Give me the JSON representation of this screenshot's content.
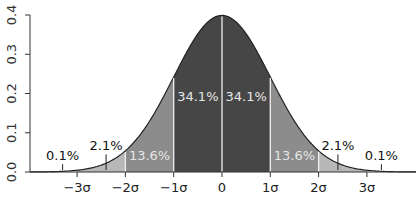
{
  "chart_data": {
    "type": "area",
    "title": "",
    "xlabel": "",
    "ylabel": "",
    "xlim": [
      -4,
      4
    ],
    "ylim": [
      0,
      0.4
    ],
    "grid": false,
    "x_ticks": [
      {
        "value": -3,
        "label": "−3σ"
      },
      {
        "value": -2,
        "label": "−2σ"
      },
      {
        "value": -1,
        "label": "−1σ"
      },
      {
        "value": 0,
        "label": "0"
      },
      {
        "value": 1,
        "label": "1σ"
      },
      {
        "value": 2,
        "label": "2σ"
      },
      {
        "value": 3,
        "label": "3σ"
      }
    ],
    "y_ticks": [
      {
        "value": 0.0,
        "label": "0.0"
      },
      {
        "value": 0.1,
        "label": "0.1"
      },
      {
        "value": 0.2,
        "label": "0.2"
      },
      {
        "value": 0.3,
        "label": "0.3"
      },
      {
        "value": 0.4,
        "label": "0.4"
      }
    ],
    "series": [
      {
        "name": "standard normal density",
        "function": "N(0,1) pdf",
        "peak": 0.399
      }
    ],
    "regions": [
      {
        "from": -4,
        "to": -3,
        "percent": "0.1%",
        "color": "#ffffff"
      },
      {
        "from": -3,
        "to": -2,
        "percent": "2.1%",
        "color": "#b8b8b8"
      },
      {
        "from": -2,
        "to": -1,
        "percent": "13.6%",
        "color": "#8c8c8c"
      },
      {
        "from": -1,
        "to": 0,
        "percent": "34.1%",
        "color": "#464646"
      },
      {
        "from": 0,
        "to": 1,
        "percent": "34.1%",
        "color": "#464646"
      },
      {
        "from": 1,
        "to": 2,
        "percent": "13.6%",
        "color": "#8c8c8c"
      },
      {
        "from": 2,
        "to": 3,
        "percent": "2.1%",
        "color": "#b8b8b8"
      },
      {
        "from": 3,
        "to": 4,
        "percent": "0.1%",
        "color": "#ffffff"
      }
    ],
    "annotations": [
      {
        "text": "0.1%",
        "x": -3.3,
        "y": 0.03,
        "color": "#111111",
        "leader": true
      },
      {
        "text": "2.1%",
        "x": -2.4,
        "y": 0.055,
        "color": "#111111",
        "leader": true
      },
      {
        "text": "13.6%",
        "x": -1.5,
        "y": 0.03,
        "color": "#e6e6e6"
      },
      {
        "text": "34.1%",
        "x": -0.5,
        "y": 0.18,
        "color": "#e6e6e6"
      },
      {
        "text": "34.1%",
        "x": 0.5,
        "y": 0.18,
        "color": "#e6e6e6"
      },
      {
        "text": "13.6%",
        "x": 1.5,
        "y": 0.03,
        "color": "#e6e6e6"
      },
      {
        "text": "2.1%",
        "x": 2.4,
        "y": 0.055,
        "color": "#111111",
        "leader": true
      },
      {
        "text": "0.1%",
        "x": 3.3,
        "y": 0.03,
        "color": "#111111",
        "leader": true
      }
    ]
  },
  "layout": {
    "plot_left": 30,
    "baseline_y": 172,
    "top_y": 15,
    "zero_x": 222,
    "sigma_px": 48.3,
    "x_min_px": 30,
    "x_max_px": 416
  }
}
